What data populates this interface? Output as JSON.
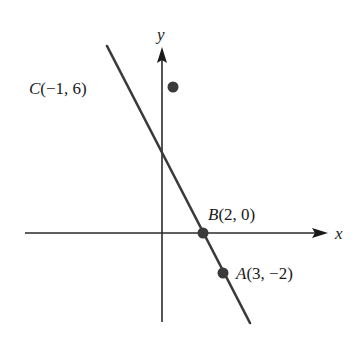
{
  "figure": {
    "x_axis_label": "x",
    "y_axis_label": "y",
    "points": [
      {
        "name": "C",
        "label": "C(−1, 6)",
        "letter": "C",
        "coords": "(−1, 6)",
        "x": -1,
        "y": 6
      },
      {
        "name": "B",
        "label": "B(2, 0)",
        "letter": "B",
        "coords": "(2, 0)",
        "x": 2,
        "y": 0
      },
      {
        "name": "A",
        "label": "A(3, −2)",
        "letter": "A",
        "coords": "(3, −2)",
        "x": 3,
        "y": -2
      }
    ],
    "line_description": "Straight line through A, B, and C",
    "colors": {
      "line": "#3a3a3a",
      "axes": "#2a2a2a",
      "points": "#3a3a3a",
      "text": "#1a1a1a",
      "background": "#ffffff"
    }
  }
}
